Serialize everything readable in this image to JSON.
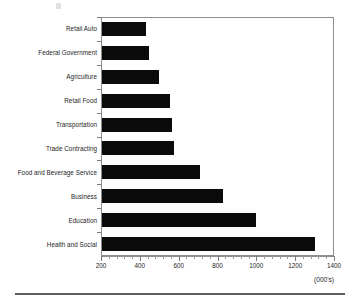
{
  "chart_data": {
    "type": "bar",
    "orientation": "horizontal",
    "title": "",
    "subtitle": "",
    "xlabel": "(000's)",
    "ylabel": "",
    "xlim": [
      200,
      1400
    ],
    "xticks": [
      200,
      400,
      600,
      800,
      1000,
      1200,
      1400
    ],
    "xtick_labels": [
      "200",
      "400",
      "600",
      "800",
      "1000",
      "1200",
      "1400"
    ],
    "minor_tick_step": 40,
    "grid": false,
    "legend": false,
    "bar_color": "#0b0b0b",
    "axis_color": "#8d8d8d",
    "categories": [
      "Retail Auto",
      "Federal Government",
      "Agriculture",
      "Retail Food",
      "Transportation",
      "Trade Contracting",
      "Food and Beverage Service",
      "Business",
      "Education",
      "Health and Social"
    ],
    "values": [
      427,
      442,
      494,
      550,
      561,
      571,
      705,
      824,
      994,
      1298
    ],
    "units_note": "(000's)"
  },
  "figure": {
    "unit_label": "(000's)"
  }
}
